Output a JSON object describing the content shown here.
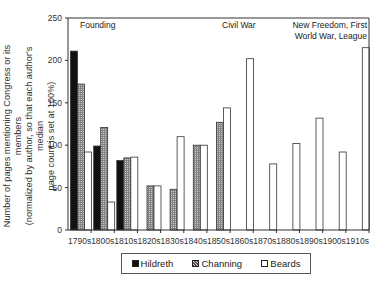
{
  "chart_data": {
    "type": "bar",
    "title": "",
    "xlabel": "",
    "ylabel": "Number of pages mentioning Congress or its members (normalized by author, so that each author's median page count is set at 100%)",
    "ylabel_lines": [
      "Number of pages mentioning Congress or its members",
      "(normalized by author, so that each author's median",
      "page count is set at 100%)"
    ],
    "ylim": [
      0,
      250
    ],
    "yticks": [
      0,
      50,
      100,
      150,
      200,
      250
    ],
    "grid": false,
    "legend_position": "bottom",
    "categories": [
      "1790s",
      "1800s",
      "1810s",
      "1820s",
      "1830s",
      "1840s",
      "1850s",
      "1860s",
      "1870s",
      "1880s",
      "1890s",
      "1900s",
      "1910s"
    ],
    "series": [
      {
        "name": "Hildreth",
        "fill": "#111111",
        "pattern": "solid",
        "values": [
          211,
          99,
          82,
          null,
          null,
          null,
          null,
          null,
          null,
          null,
          null,
          null,
          null
        ]
      },
      {
        "name": "Channing",
        "fill": "#9a9a9a",
        "pattern": "hatched",
        "values": [
          172,
          121,
          85,
          52,
          48,
          100,
          127,
          null,
          null,
          null,
          null,
          null,
          null
        ]
      },
      {
        "name": "Beards",
        "fill": "#ffffff",
        "pattern": "outline",
        "values": [
          92,
          33,
          86,
          52,
          110,
          100,
          144,
          202,
          78,
          102,
          132,
          92,
          215
        ]
      }
    ],
    "annotations": [
      {
        "text": "Founding",
        "lines": [
          "Founding"
        ],
        "near": "1790s-1800s"
      },
      {
        "text": "Civil War",
        "lines": [
          "Civil War"
        ],
        "near": "1860s"
      },
      {
        "text": "New Freedom, First World War, League",
        "lines": [
          "New Freedom, First",
          "World War, League"
        ],
        "near": "1910s"
      }
    ]
  },
  "legend": {
    "items": [
      {
        "label": "Hildreth"
      },
      {
        "label": "Channing"
      },
      {
        "label": "Beards"
      }
    ]
  }
}
